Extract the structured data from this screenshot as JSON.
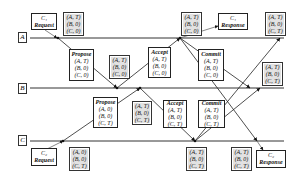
{
  "timelines": [
    {
      "id": "A",
      "label": "A"
    },
    {
      "id": "B",
      "label": "B"
    },
    {
      "id": "C",
      "label": "C"
    }
  ],
  "messages": {
    "c1_request": {
      "line1": "C₁",
      "line2": "Request"
    },
    "c1_response": {
      "line1": "C₁",
      "line2": "Response"
    },
    "c2_request": {
      "line1": "C₂",
      "line2": "Request"
    },
    "c2_response": {
      "line1": "C₂",
      "line2": "Response"
    },
    "propose_a": {
      "title": "Propose",
      "rows": [
        "(A, T)",
        "(B, 0)",
        "(C, 0)"
      ]
    },
    "accept_a": {
      "title": "Accept",
      "rows": [
        "(A, T)",
        "(B, 0)",
        "(C, 0)"
      ]
    },
    "commit_a": {
      "title": "Commit",
      "rows": [
        "(A, T)",
        "(B, 0)",
        "(C, 0)"
      ]
    },
    "propose_c": {
      "title": "Propose",
      "rows": [
        "(A, 0)",
        "(B, 0)",
        "(C, T)"
      ]
    },
    "accept_c": {
      "title": "Accept",
      "rows": [
        "(A, T)",
        "(B, 0)",
        "(C, T)"
      ]
    },
    "commit_c": {
      "title": "Commit",
      "rows": [
        "(A, T)",
        "(B, 0)",
        "(C, T)"
      ]
    }
  },
  "states": {
    "a_initial": [
      "(A, T)",
      "(B, 0)",
      "(C, 0)"
    ],
    "b_after_propose_a": [
      "(A, T)",
      "(B, 0)",
      "(C, 0)"
    ],
    "a_after_accept": [
      "(A, T)",
      "(B, 0)",
      "(C, 0)"
    ],
    "a_final": [
      "(A, T)",
      "(B, 0)",
      "(C, T)"
    ],
    "b_final": [
      "(A, T)",
      "(B, 0)",
      "(C, T)"
    ],
    "b_after_propose_c": [
      "(A, T)",
      "(B, 0)",
      "(C, T)"
    ],
    "c_initial": [
      "(A, 0)",
      "(B, 0)",
      "(C, T)"
    ],
    "c_after_accept": [
      "(A, T)",
      "(B, 0)",
      "(C, T)"
    ],
    "c_final": [
      "(A, T)",
      "(B, 0)",
      "(C, T)"
    ]
  },
  "colors": {
    "line": "#222222",
    "state_fill": "#e2e2e2",
    "box_fill": "#ffffff"
  }
}
